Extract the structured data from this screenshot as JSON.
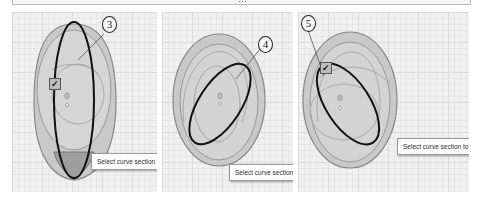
{
  "header": {
    "title_fragment": "…"
  },
  "panels": [
    {
      "step": "3",
      "tooltip": "Select curve section to trim",
      "has_checkbox": true
    },
    {
      "step": "4",
      "tooltip": "Select curve section to trim",
      "has_checkbox": false
    },
    {
      "step": "5",
      "tooltip": "Select curve section to trim",
      "has_checkbox": true
    }
  ],
  "icons": {
    "checkbox": "✓"
  },
  "colors": {
    "canvas": "#f0f0f0",
    "grid": "#dcdcdc",
    "outer_shape": "#c8c8c8",
    "shape_stroke": "#8a8a8a",
    "selected_curve": "#111111",
    "tooltip_bg": "#fbfbfb"
  }
}
